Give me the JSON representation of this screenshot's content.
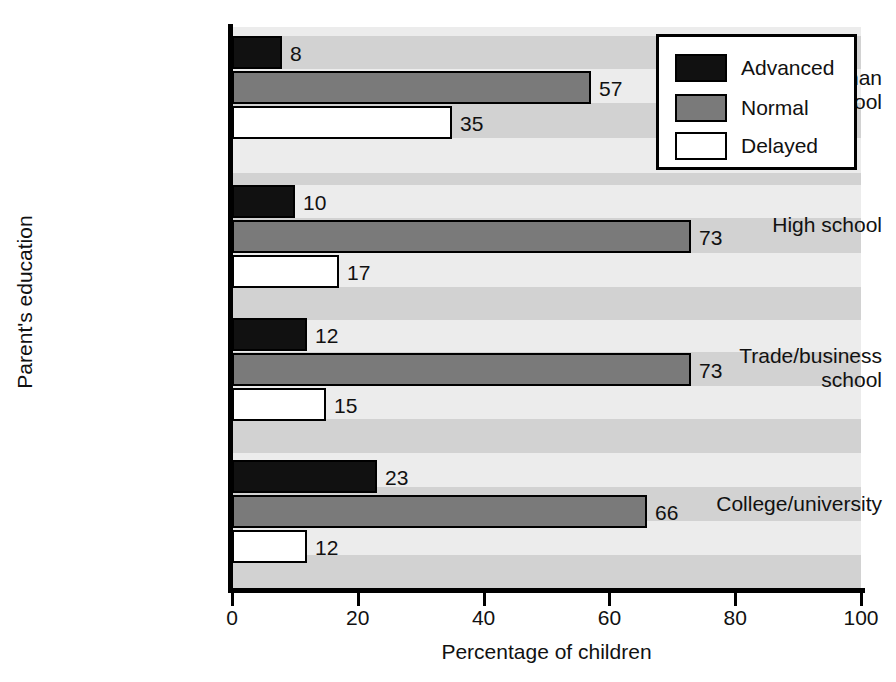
{
  "chart_data": {
    "type": "bar",
    "orientation": "horizontal",
    "title": "",
    "xlabel": "Percentage of children",
    "ylabel": "Parent's education",
    "xlim": [
      0,
      100
    ],
    "xticks": [
      0,
      20,
      40,
      60,
      80,
      100
    ],
    "xtick_labels": [
      "0",
      "20",
      "40",
      "60",
      "80",
      "100"
    ],
    "grid": false,
    "background_banding": true,
    "legend_position": "top-right",
    "categories": [
      "Less than high school",
      "High school",
      "Trade/business school",
      "College/university"
    ],
    "category_label_lines": [
      [
        "Less than",
        "high school"
      ],
      [
        "High school"
      ],
      [
        "Trade/business",
        "school"
      ],
      [
        "College/university"
      ]
    ],
    "series": [
      {
        "name": "Advanced",
        "color": "#111111",
        "values": [
          8,
          10,
          12,
          23
        ],
        "value_labels": [
          "8",
          "10",
          "12",
          "23"
        ]
      },
      {
        "name": "Normal",
        "color": "#7a7a7a",
        "values": [
          57,
          73,
          73,
          66
        ],
        "value_labels": [
          "57",
          "73",
          "73",
          "66"
        ]
      },
      {
        "name": "Delayed",
        "color": "#ffffff",
        "values": [
          35,
          17,
          15,
          12
        ],
        "value_labels": [
          "35",
          "17",
          "15",
          "12"
        ]
      }
    ]
  },
  "legend": {
    "items": [
      {
        "label": "Advanced",
        "swatch": "advanced"
      },
      {
        "label": "Normal",
        "swatch": "normal"
      },
      {
        "label": "Delayed",
        "swatch": "delayed"
      }
    ]
  },
  "axes": {
    "x_title": "Percentage of children",
    "y_title": "Parent's education",
    "x_tick_labels": [
      "0",
      "20",
      "40",
      "60",
      "80",
      "100"
    ]
  },
  "bars": [
    {
      "group": 0,
      "series": "Advanced",
      "value": 8,
      "label": "8"
    },
    {
      "group": 0,
      "series": "Normal",
      "value": 57,
      "label": "57"
    },
    {
      "group": 0,
      "series": "Delayed",
      "value": 35,
      "label": "35"
    },
    {
      "group": 1,
      "series": "Advanced",
      "value": 10,
      "label": "10"
    },
    {
      "group": 1,
      "series": "Normal",
      "value": 73,
      "label": "73"
    },
    {
      "group": 1,
      "series": "Delayed",
      "value": 17,
      "label": "17"
    },
    {
      "group": 2,
      "series": "Advanced",
      "value": 12,
      "label": "12"
    },
    {
      "group": 2,
      "series": "Normal",
      "value": 73,
      "label": "73"
    },
    {
      "group": 2,
      "series": "Delayed",
      "value": 15,
      "label": "15"
    },
    {
      "group": 3,
      "series": "Advanced",
      "value": 23,
      "label": "23"
    },
    {
      "group": 3,
      "series": "Normal",
      "value": 66,
      "label": "66"
    },
    {
      "group": 3,
      "series": "Delayed",
      "value": 12,
      "label": "12"
    }
  ],
  "category_labels": [
    {
      "lines": [
        "Less than",
        "high school"
      ],
      "top": 66
    },
    {
      "lines": [
        "High school"
      ],
      "top": 213
    },
    {
      "lines": [
        "Trade/business",
        "school"
      ],
      "top": 344
    },
    {
      "lines": [
        "College/university"
      ],
      "top": 492
    }
  ]
}
